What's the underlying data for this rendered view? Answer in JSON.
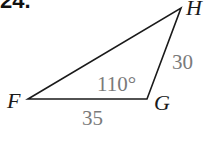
{
  "problem": {
    "number": "24."
  },
  "triangle": {
    "vertices": {
      "F": {
        "label": "F",
        "x": 28,
        "y": 99
      },
      "G": {
        "label": "G",
        "x": 147,
        "y": 99
      },
      "H": {
        "label": "H",
        "x": 181,
        "y": 8
      }
    },
    "measures": {
      "side_FG": "35",
      "side_GH": "30",
      "angle_G": "110°"
    },
    "stroke_color": "#1a1a1a",
    "measure_color": "#7a7a7a"
  }
}
